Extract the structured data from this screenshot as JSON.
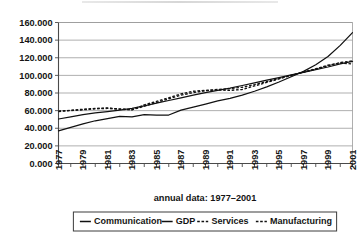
{
  "chart_data": {
    "type": "line",
    "title": "",
    "xlabel": "annual data: 1977–2001",
    "ylabel": "",
    "xlim": [
      1977,
      2001
    ],
    "ylim": [
      0.0,
      160.0
    ],
    "grid": true,
    "legend_position": "bottom",
    "x": [
      1977,
      1978,
      1979,
      1980,
      1981,
      1982,
      1983,
      1984,
      1985,
      1986,
      1987,
      1988,
      1989,
      1990,
      1991,
      1992,
      1993,
      1994,
      1995,
      1996,
      1997,
      1998,
      1999,
      2000,
      2001
    ],
    "xtick_labels": [
      "1977",
      "1978",
      "1979",
      "1980",
      "1981",
      "1982",
      "1983",
      "1984",
      "1985",
      "1986",
      "1987",
      "1988",
      "1989",
      "1990",
      "1991",
      "1992",
      "1993",
      "1994",
      "1995",
      "1996",
      "1997",
      "1998",
      "1999",
      "2000",
      "2001"
    ],
    "xtick_labels_shown": [
      "1977",
      "1979",
      "1981",
      "1983",
      "1985",
      "1987",
      "1989",
      "1991",
      "1993",
      "1995",
      "1997",
      "1999",
      "2001"
    ],
    "ytick_labels": [
      "0.000",
      "20.000",
      "40.000",
      "60.000",
      "80.000",
      "100.000",
      "120.000",
      "140.000",
      "160.000"
    ],
    "ytick_values": [
      0.0,
      20.0,
      40.0,
      60.0,
      80.0,
      100.0,
      120.0,
      140.0,
      160.0
    ],
    "series": [
      {
        "name": "Communication",
        "style": "solid",
        "color": "#111111",
        "values": [
          37.0,
          41.0,
          45.0,
          48.5,
          51.0,
          53.5,
          53.0,
          55.5,
          55.0,
          55.0,
          60.5,
          64.0,
          67.5,
          71.0,
          74.0,
          77.5,
          82.0,
          87.0,
          92.5,
          98.5,
          104.5,
          112.0,
          121.5,
          134.0,
          148.5
        ]
      },
      {
        "name": "GDP",
        "style": "solid",
        "color": "#111111",
        "values": [
          50.5,
          53.0,
          55.5,
          57.5,
          59.0,
          60.5,
          62.5,
          65.5,
          68.5,
          71.5,
          74.5,
          77.5,
          80.5,
          83.0,
          85.5,
          88.5,
          91.5,
          94.5,
          97.5,
          100.5,
          103.5,
          106.5,
          109.5,
          113.0,
          116.0
        ]
      },
      {
        "name": "Services",
        "style": "dashed",
        "color": "#111111",
        "values": [
          59.5,
          60.0,
          61.0,
          62.0,
          62.5,
          62.0,
          61.0,
          65.0,
          69.0,
          73.5,
          77.5,
          80.5,
          82.5,
          84.0,
          85.0,
          86.5,
          89.5,
          93.0,
          96.5,
          100.0,
          103.5,
          107.0,
          111.0,
          114.5,
          116.5
        ]
      },
      {
        "name": "Manufacturing",
        "style": "dashed",
        "color": "#111111",
        "values": [
          59.0,
          60.5,
          61.5,
          62.5,
          63.0,
          61.5,
          61.0,
          66.5,
          70.5,
          74.5,
          79.0,
          82.0,
          83.0,
          83.5,
          83.0,
          84.0,
          88.0,
          92.0,
          96.0,
          100.0,
          104.0,
          107.5,
          111.5,
          114.0,
          113.0
        ]
      }
    ]
  },
  "legend": {
    "items": [
      {
        "label": "Communication",
        "style": "solid"
      },
      {
        "label": "GDP",
        "style": "solid"
      },
      {
        "label": "Services",
        "style": "dashed"
      },
      {
        "label": "Manufacturing",
        "style": "dashed"
      }
    ]
  },
  "colors": {
    "ink": "#111111",
    "grid": "#8d8d8d",
    "axis": "#4a4a4a",
    "background": "#ffffff"
  }
}
